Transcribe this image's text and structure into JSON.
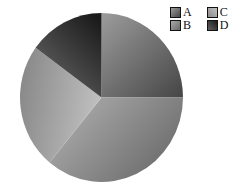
{
  "chart_data": {
    "type": "pie",
    "title": "",
    "categories": [
      "A",
      "B",
      "C",
      "D"
    ],
    "values": [
      25,
      36,
      24,
      15
    ],
    "unit": "percent",
    "start_angle_deg": 90,
    "direction": "clockwise",
    "background": "#ffffff",
    "legend": {
      "position": "top-right",
      "columns": 2,
      "entries": [
        {
          "label": "A",
          "color_from": "#9c9c9c",
          "color_to": "#454545"
        },
        {
          "label": "B",
          "color_from": "#a9a9a9",
          "color_to": "#6b6b6b"
        },
        {
          "label": "C",
          "color_from": "#c0c0c0",
          "color_to": "#8a8a8a"
        },
        {
          "label": "D",
          "color_from": "#1a1a1a",
          "color_to": "#616161"
        }
      ]
    }
  }
}
